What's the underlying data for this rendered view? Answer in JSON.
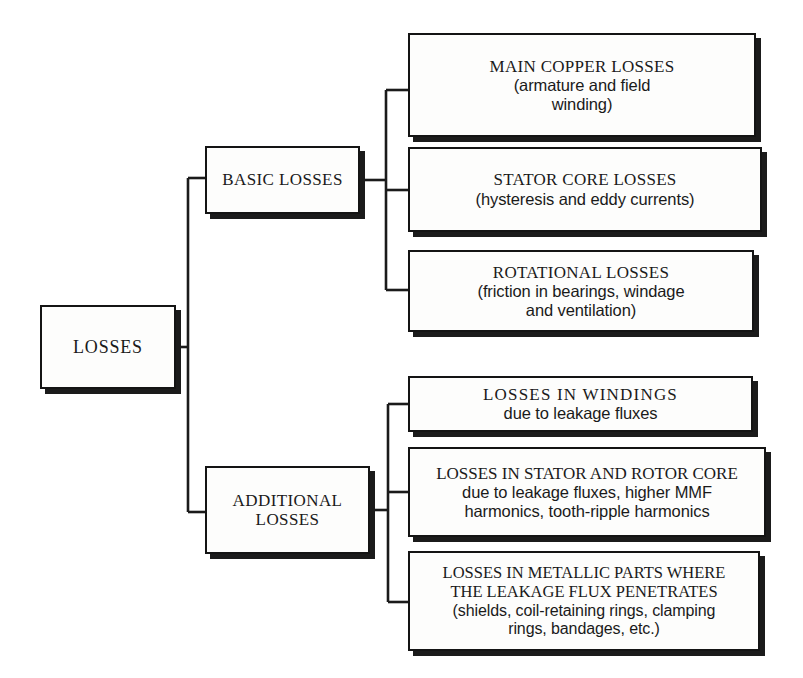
{
  "diagram": {
    "colors": {
      "background": "#ffffff",
      "box_fill": "#fdfdfc",
      "box_border": "#141414",
      "shadow": "#1b1b1b",
      "line": "#1b1b1b",
      "text": "#1a1a1a"
    },
    "root": {
      "lines": [
        "LOSSES"
      ]
    },
    "branches": [
      {
        "label": "BASIC LOSSES",
        "lines": [
          "BASIC LOSSES"
        ],
        "children": [
          {
            "lines": [
              "MAIN COPPER LOSSES",
              "(armature and field",
              "winding)"
            ]
          },
          {
            "lines": [
              "STATOR CORE LOSSES",
              "(hysteresis and eddy currents)"
            ]
          },
          {
            "lines": [
              "ROTATIONAL LOSSES",
              "(friction in bearings, windage",
              "and ventilation)"
            ]
          }
        ]
      },
      {
        "label": "ADDITIONAL LOSSES",
        "lines": [
          "ADDITIONAL",
          "LOSSES"
        ],
        "children": [
          {
            "lines": [
              "LOSSES  IN  WINDINGS",
              "due to leakage fluxes"
            ]
          },
          {
            "lines": [
              "LOSSES IN STATOR AND ROTOR CORE",
              "due to leakage fluxes, higher MMF",
              "harmonics, tooth-ripple harmonics"
            ]
          },
          {
            "lines": [
              "LOSSES IN METALLIC PARTS WHERE",
              "THE LEAKAGE FLUX PENETRATES",
              "(shields, coil-retaining rings, clamping",
              "rings, bandages, etc.)"
            ]
          }
        ]
      }
    ]
  }
}
